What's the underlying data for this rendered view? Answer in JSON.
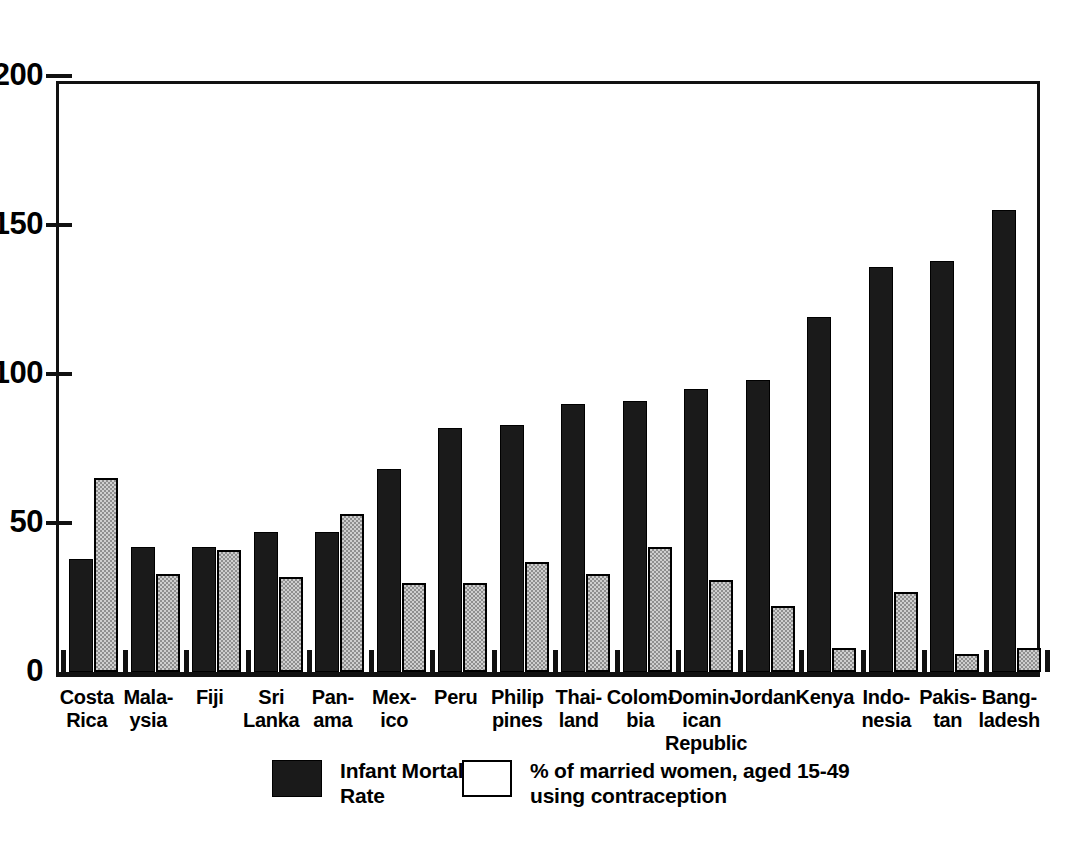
{
  "chart_data": {
    "type": "bar",
    "title": "",
    "subtitle": "",
    "xlabel": "",
    "ylabel": "",
    "ylim": [
      0,
      200
    ],
    "yticks": [
      0,
      50,
      100,
      150,
      200
    ],
    "ytick_labels": [
      "0",
      "50",
      "100",
      "150",
      "200"
    ],
    "grid": false,
    "legend_position": "bottom",
    "categories": [
      "Costa\nRica",
      "Mala-\nysia",
      "Fiji",
      "Sri\nLanka",
      "Pan-\nama",
      "Mex-\nico",
      "Peru",
      "Philip\npines",
      "Thai-\nland",
      "Colom-\nbia",
      "Domin-\nican\nRepublic",
      "Jordan",
      "Kenya",
      "Indo-\nnesia",
      "Pakis-\ntan",
      "Bang-\nladesh"
    ],
    "series": [
      {
        "name": "Infant Mortality Rate",
        "color": "#1a1a1a",
        "values": [
          38,
          42,
          42,
          47,
          47,
          68,
          82,
          83,
          90,
          91,
          95,
          98,
          119,
          136,
          138,
          155
        ]
      },
      {
        "name": "% of married women, aged 15-49 using contraception",
        "color": "#cfcfcf",
        "values": [
          65,
          33,
          41,
          32,
          53,
          30,
          30,
          37,
          33,
          42,
          31,
          22,
          8,
          27,
          6,
          8
        ]
      }
    ]
  },
  "legend": {
    "items": [
      {
        "label_line1": "Infant Mortality",
        "label_line2": "Rate",
        "swatch": "black"
      },
      {
        "label_line1": "% of married women, aged 15-49",
        "label_line2": "using contraception",
        "swatch": "white"
      }
    ]
  },
  "colors": {
    "axis": "#111111",
    "imr_bar": "#1a1a1a",
    "contraception_bar": "#cfcfcf",
    "background": "#ffffff"
  }
}
